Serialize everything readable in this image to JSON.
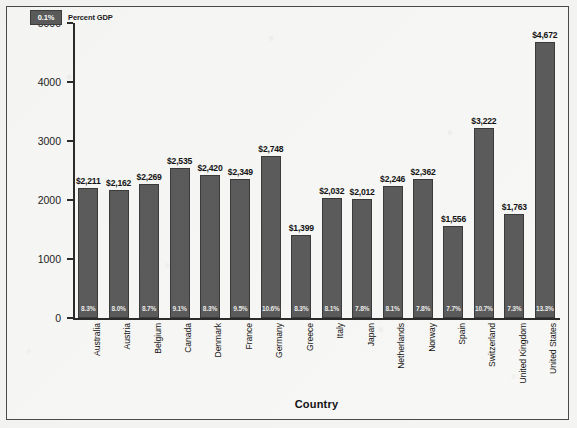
{
  "chart_data": {
    "type": "bar",
    "title": "",
    "xlabel": "Country",
    "ylabel": "Per Capita (U.S. Dollars)",
    "ylim": [
      0,
      5000
    ],
    "yticks": [
      0,
      1000,
      2000,
      3000,
      4000,
      5000
    ],
    "ytick_labels": [
      "0",
      "1000",
      "2000",
      "3000",
      "4000",
      "5000"
    ],
    "grid": false,
    "legend_position": "top-left",
    "legend": [
      {
        "swatch_label": "0.1%",
        "label": "Percent GDP",
        "color": "#5b5b5b"
      }
    ],
    "categories": [
      "Australia",
      "Austria",
      "Belgium",
      "Canada",
      "Denmark",
      "France",
      "Germany",
      "Greece",
      "Italy",
      "Japan",
      "Netherlands",
      "Norway",
      "Spain",
      "Switzerland",
      "United Kingdom",
      "United States"
    ],
    "values": [
      2211,
      2162,
      2269,
      2535,
      2420,
      2349,
      2748,
      1399,
      2032,
      2012,
      2246,
      2362,
      1556,
      3222,
      1763,
      4672
    ],
    "value_labels": [
      "$2,211",
      "$2,162",
      "$2,269",
      "$2,535",
      "$2,420",
      "$2,349",
      "$2,748",
      "$1,399",
      "$2,032",
      "$2,012",
      "$2,246",
      "$2,362",
      "$1,556",
      "$3,222",
      "$1,763",
      "$4,672"
    ],
    "percent_gdp": [
      8.3,
      8.0,
      8.7,
      9.1,
      8.3,
      9.5,
      10.6,
      8.3,
      8.1,
      7.8,
      8.1,
      7.8,
      7.7,
      10.7,
      7.3,
      13.3
    ],
    "percent_gdp_labels": [
      "8.3%",
      "8.0%",
      "8.7%",
      "9.1%",
      "8.3%",
      "9.5%",
      "10.6%",
      "8.3%",
      "8.1%",
      "7.8%",
      "8.1%",
      "7.8%",
      "7.7%",
      "10.7%",
      "7.3%",
      "13.3%"
    ],
    "colors": {
      "bar": "#5b5b5b",
      "bar_border": "#3b3b3b",
      "axis": "#2b2b2b",
      "text": "#141414",
      "background": "#f7f7f5",
      "pct_text": "#e9e9e9"
    }
  }
}
